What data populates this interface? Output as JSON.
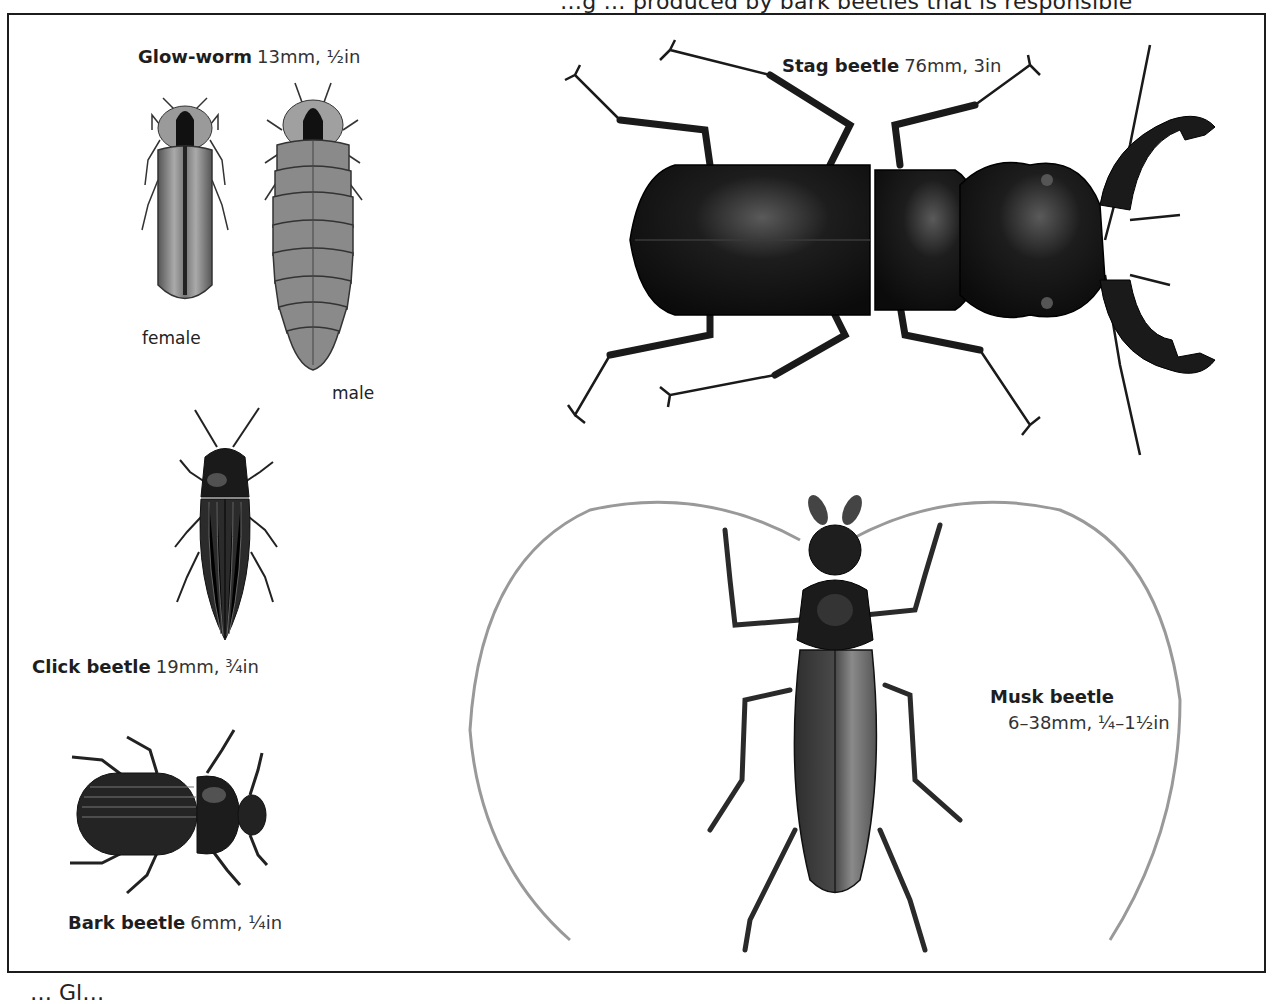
{
  "page": {
    "top_fragment": "…g … produced by bark beetles that is responsible",
    "bottom_fragment": "… Gl…"
  },
  "specimens": [
    {
      "id": "glow-worm",
      "name": "Glow-worm",
      "size": "13mm, ½in",
      "sublabels": {
        "female": "female",
        "male": "male"
      }
    },
    {
      "id": "stag-beetle",
      "name": "Stag beetle",
      "size": "76mm, 3in"
    },
    {
      "id": "click-beetle",
      "name": "Click beetle",
      "size": "19mm, ¾in"
    },
    {
      "id": "musk-beetle",
      "name": "Musk beetle",
      "size": "6–38mm, ¼–1½in"
    },
    {
      "id": "bark-beetle",
      "name": "Bark beetle",
      "size": "6mm, ¼in"
    }
  ],
  "colors": {
    "ink": "#1c1c1c",
    "background": "#ffffff",
    "stag_body": "#141414",
    "musk_body": "#3a3a3a",
    "glow_body": "#777777"
  }
}
